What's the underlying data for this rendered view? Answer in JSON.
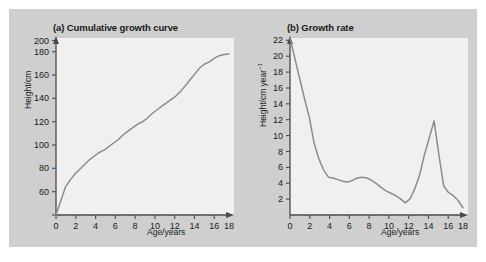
{
  "figure": {
    "background_color": "#cfcfcf",
    "plot_background_color": "#f0f0f0",
    "curve_color": "#8c8c8c",
    "axis_color": "#4a4a4a"
  },
  "charts": [
    {
      "panel_label": "(a)",
      "title": "(a) Cumulative growth curve",
      "ylabel": "Height/cm",
      "xlabel": "Age/years"
    },
    {
      "panel_label": "(b)",
      "title": "(b) Growth rate",
      "ylabel_main": "Height/cm year",
      "ylabel_sup": "−1",
      "xlabel": "Age/years"
    }
  ],
  "chart_data": [
    {
      "type": "line",
      "title": "(a) Cumulative growth curve",
      "xlabel": "Age/years",
      "ylabel": "Height/cm",
      "xlim": [
        0,
        18
      ],
      "ylim": [
        50,
        200
      ],
      "xticks": [
        0,
        2,
        4,
        6,
        8,
        10,
        12,
        14,
        16,
        18
      ],
      "yticks": [
        60,
        80,
        100,
        120,
        140,
        160,
        180,
        200
      ],
      "grid": false,
      "legend": "none",
      "x": [
        0,
        0.5,
        1,
        1.5,
        2,
        2.5,
        3,
        3.5,
        4,
        4.5,
        5,
        5.5,
        6,
        6.5,
        7,
        7.5,
        8,
        8.5,
        9,
        9.5,
        10,
        10.5,
        11,
        11.5,
        12,
        12.5,
        13,
        13.5,
        14,
        14.5,
        15,
        15.5,
        16,
        16.5,
        17,
        17.5,
        18
      ],
      "y": [
        50,
        62,
        74,
        80,
        85,
        89,
        93,
        97,
        100,
        103,
        105,
        108,
        111,
        114,
        118,
        121,
        124,
        127,
        129,
        132,
        136,
        139,
        142,
        145,
        148,
        151,
        155,
        160,
        165,
        170,
        175,
        178,
        180,
        183,
        185,
        186,
        186.5
      ]
    },
    {
      "type": "line",
      "title": "(b) Growth rate",
      "xlabel": "Age/years",
      "ylabel": "Height/cm year−1",
      "xlim": [
        0,
        18
      ],
      "ylim": [
        0,
        22
      ],
      "xticks": [
        0,
        2,
        4,
        6,
        8,
        10,
        12,
        14,
        16,
        18
      ],
      "yticks": [
        2,
        4,
        6,
        8,
        10,
        12,
        14,
        16,
        18,
        20,
        22
      ],
      "grid": false,
      "legend": "none",
      "x": [
        0,
        0.5,
        1,
        1.5,
        2,
        2.5,
        3,
        3.5,
        4,
        4.5,
        5,
        5.5,
        6,
        6.5,
        7,
        7.5,
        8,
        8.5,
        9,
        9.5,
        10,
        10.5,
        11,
        11.5,
        12,
        12.5,
        13,
        13.5,
        14,
        14.5,
        15,
        15.5,
        16,
        16.5,
        17,
        17.5,
        18
      ],
      "y": [
        22,
        19.5,
        17,
        14.5,
        12.2,
        9.0,
        7.0,
        5.6,
        4.7,
        4.6,
        4.4,
        4.2,
        4.1,
        4.3,
        4.6,
        4.7,
        4.6,
        4.3,
        3.9,
        3.4,
        3.0,
        2.7,
        2.4,
        2.0,
        1.5,
        2.0,
        3.3,
        5.0,
        7.5,
        9.6,
        11.7,
        7.5,
        3.6,
        2.8,
        2.4,
        1.8,
        0.9
      ]
    }
  ]
}
